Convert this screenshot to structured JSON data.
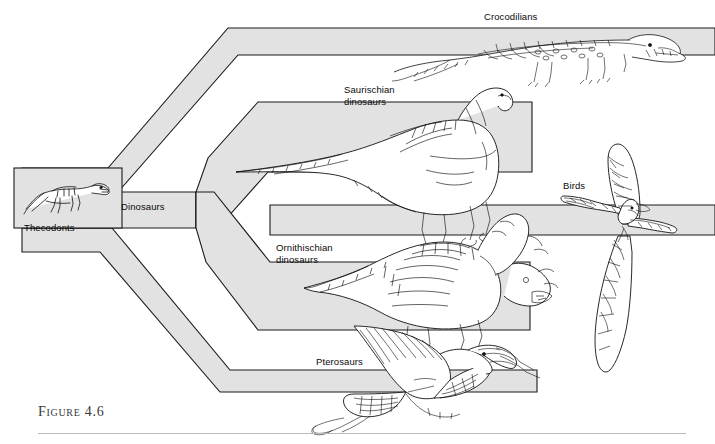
{
  "figure": {
    "caption": "Figure 4.6",
    "background_color": "#ffffff",
    "band_fill": "#e2e2e2",
    "band_stroke": "#1a1a1a",
    "text_color": "#0a0a0a",
    "caption_color": "#3a3a3a",
    "rule_color": "#b9b9b9"
  },
  "root": {
    "label": "Thecodonts",
    "artwork": "thecodont-reptile-drawing"
  },
  "nodes": [
    {
      "id": "dinosaurs",
      "label": "Dinosaurs",
      "x": 128,
      "y": 207
    }
  ],
  "branches": [
    {
      "id": "crocodilians",
      "label": "Crocodilians",
      "label_x": 487,
      "label_y": 12,
      "artwork": "crocodile-drawing",
      "terminal_x": 715
    },
    {
      "id": "saurischian",
      "label": "Saurischian\ndinosaurs",
      "label_x": 345,
      "label_y": 88,
      "artwork": "sauropod-dinosaur-drawing",
      "terminal_x": 532
    },
    {
      "id": "birds",
      "label": "Birds",
      "label_x": 566,
      "label_y": 182,
      "artwork": "archaeopteryx-bird-drawing",
      "terminal_x": 715
    },
    {
      "id": "ornithischian",
      "label": "Ornithischian\ndinosaurs",
      "label_x": 278,
      "label_y": 245,
      "artwork": "ceratopsian-dinosaur-drawing",
      "terminal_x": 530
    },
    {
      "id": "pterosaurs",
      "label": "Pterosaurs",
      "label_x": 318,
      "label_y": 358,
      "artwork": "pterosaur-drawing",
      "terminal_x": 537
    }
  ]
}
